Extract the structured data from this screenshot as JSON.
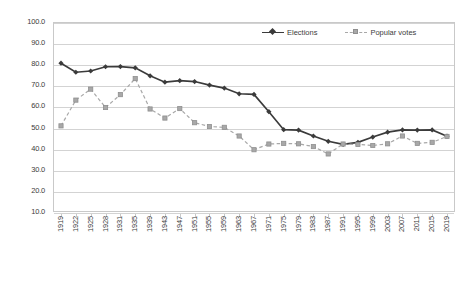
{
  "chart_data": {
    "type": "line",
    "title": "",
    "subtitle": "",
    "xlabel": "",
    "ylabel": "",
    "ylim": [
      10.0,
      100.0
    ],
    "ytick_step": 10.0,
    "grid": true,
    "legend_position": "top-right",
    "categories": [
      "1919",
      "1922",
      "1925",
      "1928",
      "1931",
      "1935",
      "1939",
      "1943",
      "1947",
      "1951",
      "1955",
      "1959",
      "1963",
      "1967",
      "1971",
      "1975",
      "1979",
      "1983",
      "1987",
      "1991",
      "1995",
      "1999",
      "2003",
      "2007",
      "2011",
      "2015",
      "2019"
    ],
    "yticks": [
      "100.0",
      "90.0",
      "80.0",
      "70.0",
      "60.0",
      "50.0",
      "40.0",
      "30.0",
      "20.0",
      "10.0"
    ],
    "series": [
      {
        "name": "Elections",
        "color": "#3b3b3b",
        "marker": "diamond",
        "style": "solid",
        "values": [
          80.5,
          76.2,
          76.8,
          78.8,
          78.9,
          78.3,
          74.5,
          71.5,
          72.2,
          71.8,
          70.1,
          68.7,
          66.0,
          65.7,
          57.5,
          49.0,
          48.8,
          46.0,
          43.5,
          42.0,
          43.0,
          45.5,
          47.8,
          48.9,
          48.8,
          48.9,
          45.9
        ]
      },
      {
        "name": "Popular votes",
        "color": "#a8a8a8",
        "marker": "square",
        "style": "dashed",
        "values": [
          50.8,
          63.0,
          68.2,
          59.5,
          65.6,
          73.2,
          58.8,
          54.5,
          59.0,
          52.3,
          50.5,
          50.1,
          46.0,
          39.5,
          42.2,
          42.5,
          42.3,
          41.0,
          37.5,
          42.2,
          42.0,
          41.5,
          42.3,
          46.0,
          42.5,
          43.0,
          45.8
        ]
      }
    ]
  },
  "legend": {
    "entries": [
      {
        "label": "Elections"
      },
      {
        "label": "Popular votes"
      }
    ]
  }
}
